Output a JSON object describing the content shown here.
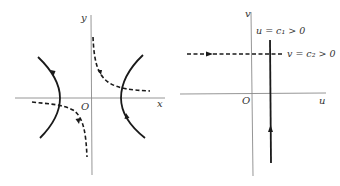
{
  "figure": {
    "left_panel": {
      "title": "xy-plane hyperbolic trajectories",
      "axis_labels": {
        "x": "x",
        "y": "y",
        "origin": "O"
      },
      "curves": [
        {
          "name": "left-hyperbola-branch",
          "style": "solid",
          "arrow_direction": "down"
        },
        {
          "name": "right-hyperbola-branch",
          "style": "solid",
          "arrow_direction": "up"
        },
        {
          "name": "upper-right-dashed-curve",
          "style": "dashed",
          "arrow_direction": "down-right"
        },
        {
          "name": "lower-left-dashed-curve",
          "style": "dashed",
          "arrow_direction": "down"
        }
      ]
    },
    "right_panel": {
      "title": "uv-plane image of trajectories",
      "axis_labels": {
        "u": "u",
        "v": "v",
        "origin": "O"
      },
      "lines": [
        {
          "name": "vertical-line-u-c1",
          "style": "solid",
          "label": "u = c₁ > 0",
          "arrow_direction": "up"
        },
        {
          "name": "horizontal-line-v-c2",
          "style": "dashed",
          "label": "v = c₂ > 0",
          "arrow_direction": "right"
        }
      ]
    },
    "colors": {
      "curve": "#1a1a1a",
      "axis": "#8a8a8a",
      "text": "#333333",
      "background": "#ffffff"
    }
  }
}
